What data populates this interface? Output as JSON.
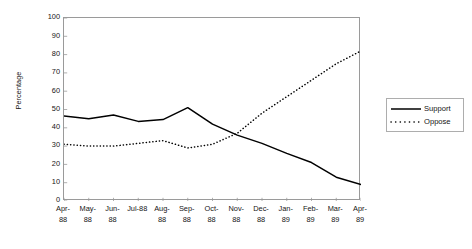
{
  "chart_data": {
    "type": "line",
    "title": "",
    "xlabel": "",
    "ylabel": "Percentage",
    "ylim": [
      0,
      100
    ],
    "ytick_step": 10,
    "grid": false,
    "legend_position": "right",
    "categories": [
      "Apr-88",
      "May-88",
      "Jun-88",
      "Jul-88",
      "Aug-88",
      "Sep-88",
      "Oct-88",
      "Nov-88",
      "Dec-88",
      "Jan-89",
      "Feb-89",
      "Mar-89",
      "Apr-89"
    ],
    "category_lines": [
      [
        "Apr-",
        "88"
      ],
      [
        "May-",
        "88"
      ],
      [
        "Jun-",
        "88"
      ],
      [
        "Jul-88",
        ""
      ],
      [
        "Aug-",
        "88"
      ],
      [
        "Sep-",
        "88"
      ],
      [
        "Oct-",
        "88"
      ],
      [
        "Nov-",
        "88"
      ],
      [
        "Dec-",
        "88"
      ],
      [
        "Jan-",
        "89"
      ],
      [
        "Feb-",
        "89"
      ],
      [
        "Mar-",
        "89"
      ],
      [
        "Apr-",
        "89"
      ]
    ],
    "yticks": [
      0,
      10,
      20,
      30,
      40,
      50,
      60,
      70,
      80,
      90,
      100
    ],
    "series": [
      {
        "name": "Support",
        "style": "solid",
        "color": "#000000",
        "values": [
          46.5,
          45,
          47,
          43.5,
          44.5,
          51,
          42,
          36,
          31.5,
          26,
          21,
          13,
          9
        ]
      },
      {
        "name": "Oppose",
        "style": "dotted",
        "color": "#000000",
        "values": [
          31,
          30,
          30,
          31.5,
          33,
          29,
          31,
          37,
          48,
          57,
          66,
          75,
          82
        ]
      }
    ]
  },
  "legend": {
    "items": [
      {
        "label": "Support",
        "style": "solid"
      },
      {
        "label": "Oppose",
        "style": "dotted"
      }
    ]
  }
}
